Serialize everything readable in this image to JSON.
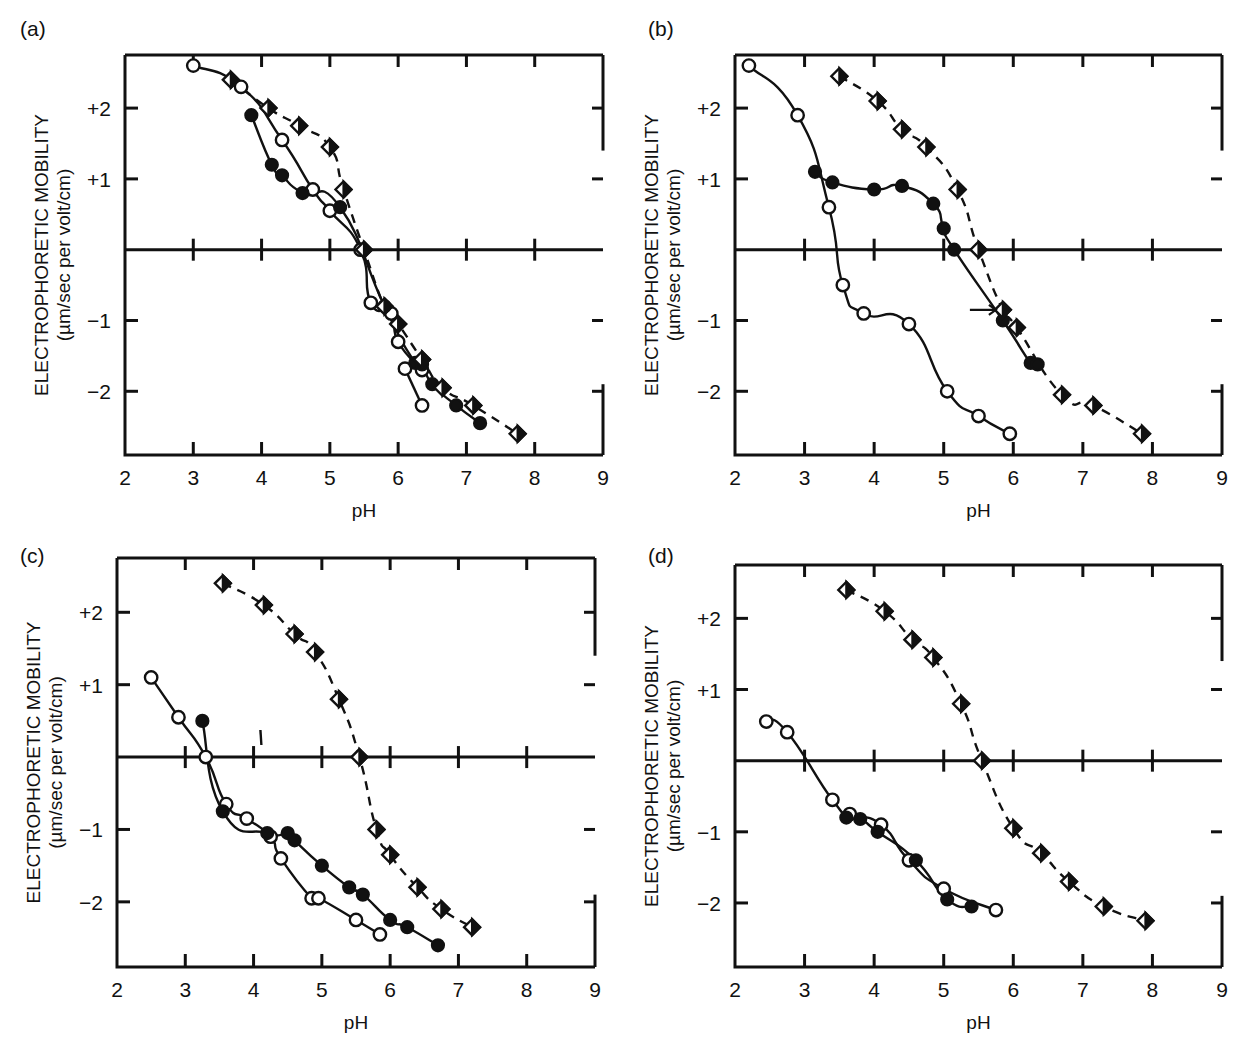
{
  "figure": {
    "panel_labels": [
      "(a)",
      "(b)",
      "(c)",
      "(d)"
    ],
    "xlabel": "pH",
    "ylabel_line1": "ELECTROPHORETIC MOBILITY",
    "ylabel_line2": "(µm/sec per volt/cm)",
    "x_tick_labels": [
      "2",
      "3",
      "4",
      "5",
      "6",
      "7",
      "8",
      "9"
    ],
    "y_tick_labels": [
      "+2",
      "+1",
      "−1",
      "−2"
    ]
  },
  "chart_data": [
    {
      "type": "line",
      "panel": "(a)",
      "title": "",
      "xlabel": "pH",
      "ylabel": "ELECTROPHORETIC MOBILITY (µm/sec per volt/cm)",
      "xlim": [
        2,
        9
      ],
      "ylim": [
        -2.9,
        2.75
      ],
      "xticks": [
        2,
        3,
        4,
        5,
        6,
        7,
        8,
        9
      ],
      "yticks": [
        2,
        1,
        -1,
        -2
      ],
      "grid": false,
      "legend": "none",
      "series": [
        {
          "name": "open-circle",
          "marker": "open-circle",
          "linestyle": "solid",
          "x": [
            3.0,
            3.7,
            4.3,
            4.75,
            5.0,
            5.45,
            5.6,
            5.9,
            6.0,
            6.35
          ],
          "y": [
            2.6,
            2.3,
            1.55,
            0.85,
            0.55,
            0.0,
            -0.75,
            -0.9,
            -1.3,
            -1.7
          ]
        },
        {
          "name": "open-circle-tail",
          "marker": "open-circle",
          "linestyle": "solid",
          "x": [
            6.1,
            6.35
          ],
          "y": [
            -1.68,
            -2.2
          ]
        },
        {
          "name": "filled-circle",
          "marker": "filled-circle",
          "linestyle": "solid",
          "x": [
            3.85,
            4.15,
            4.3,
            4.6,
            5.15,
            5.8,
            6.25,
            6.35,
            6.5,
            6.85,
            7.2
          ],
          "y": [
            1.9,
            1.2,
            1.05,
            0.8,
            0.6,
            -0.8,
            -1.6,
            -1.62,
            -1.9,
            -2.2,
            -2.45
          ]
        },
        {
          "name": "half-filled-diamond",
          "marker": "half-diamond",
          "linestyle": "dashed",
          "x": [
            3.55,
            4.1,
            4.55,
            5.0,
            5.2,
            5.5,
            5.8,
            6.0,
            6.35,
            6.65,
            7.1,
            7.75
          ],
          "y": [
            2.4,
            2.0,
            1.75,
            1.45,
            0.85,
            0.0,
            -0.8,
            -1.05,
            -1.55,
            -1.95,
            -2.2,
            -2.6
          ]
        }
      ]
    },
    {
      "type": "line",
      "panel": "(b)",
      "title": "",
      "xlabel": "pH",
      "ylabel": "ELECTROPHORETIC MOBILITY (µm/sec per volt/cm)",
      "xlim": [
        2,
        9
      ],
      "ylim": [
        -2.9,
        2.75
      ],
      "xticks": [
        2,
        3,
        4,
        5,
        6,
        7,
        8,
        9
      ],
      "yticks": [
        2,
        1,
        -1,
        -2
      ],
      "grid": false,
      "legend": "none",
      "annotations": [
        {
          "type": "arrow",
          "x": 5.75,
          "y": -0.85,
          "direction": "right"
        }
      ],
      "series": [
        {
          "name": "open-circle",
          "marker": "open-circle",
          "linestyle": "solid",
          "x": [
            2.2,
            2.9,
            3.35,
            3.55,
            3.85,
            4.5,
            5.05,
            5.5,
            5.95
          ],
          "y": [
            2.6,
            1.9,
            0.6,
            -0.5,
            -0.9,
            -1.05,
            -2.0,
            -2.35,
            -2.6
          ]
        },
        {
          "name": "filled-circle",
          "marker": "filled-circle",
          "linestyle": "solid",
          "x": [
            3.15,
            3.4,
            4.0,
            4.4,
            4.85,
            5.0,
            5.15,
            5.85,
            6.25,
            6.35
          ],
          "y": [
            1.1,
            0.95,
            0.85,
            0.9,
            0.65,
            0.3,
            0.0,
            -1.0,
            -1.6,
            -1.62
          ]
        },
        {
          "name": "half-filled-diamond",
          "marker": "half-diamond",
          "linestyle": "dashed",
          "x": [
            3.5,
            4.05,
            4.4,
            4.75,
            5.2,
            5.5,
            5.85,
            6.05,
            6.7,
            7.15,
            7.85
          ],
          "y": [
            2.45,
            2.1,
            1.7,
            1.45,
            0.85,
            0.0,
            -0.85,
            -1.1,
            -2.05,
            -2.2,
            -2.6
          ]
        }
      ]
    },
    {
      "type": "line",
      "panel": "(c)",
      "title": "",
      "xlabel": "pH",
      "ylabel": "ELECTROPHORETIC MOBILITY (µm/sec per volt/cm)",
      "xlim": [
        2,
        9
      ],
      "ylim": [
        -2.9,
        2.75
      ],
      "xticks": [
        2,
        3,
        4,
        5,
        6,
        7,
        8,
        9
      ],
      "yticks": [
        2,
        1,
        -1,
        -2
      ],
      "grid": false,
      "legend": "none",
      "annotations": [
        {
          "type": "tick-mark",
          "x": 4.1,
          "y": 0.25
        }
      ],
      "series": [
        {
          "name": "open-circle",
          "marker": "open-circle",
          "linestyle": "solid",
          "x": [
            2.5,
            2.9,
            3.3,
            3.6,
            3.9,
            4.25,
            4.4,
            4.85,
            4.95,
            5.5,
            5.85
          ],
          "y": [
            1.1,
            0.55,
            0.0,
            -0.65,
            -0.85,
            -1.1,
            -1.4,
            -1.95,
            -1.95,
            -2.25,
            -2.45
          ]
        },
        {
          "name": "filled-circle",
          "marker": "filled-circle",
          "linestyle": "solid",
          "x": [
            3.25,
            3.55,
            4.2,
            4.5,
            4.6,
            5.0,
            5.4,
            5.6,
            6.0,
            6.25,
            6.7
          ],
          "y": [
            0.5,
            -0.75,
            -1.05,
            -1.05,
            -1.15,
            -1.5,
            -1.8,
            -1.9,
            -2.25,
            -2.35,
            -2.6
          ]
        },
        {
          "name": "half-filled-diamond",
          "marker": "half-diamond",
          "linestyle": "dashed",
          "x": [
            3.55,
            4.15,
            4.6,
            4.9,
            5.25,
            5.55,
            5.8,
            6.0,
            6.4,
            6.75,
            7.2
          ],
          "y": [
            2.4,
            2.1,
            1.7,
            1.45,
            0.8,
            0.0,
            -1.0,
            -1.35,
            -1.8,
            -2.1,
            -2.35
          ]
        }
      ]
    },
    {
      "type": "line",
      "panel": "(d)",
      "title": "",
      "xlabel": "pH",
      "ylabel": "ELECTROPHORETIC MOBILITY (µm/sec per volt/cm)",
      "xlim": [
        2,
        9
      ],
      "ylim": [
        -2.9,
        2.75
      ],
      "xticks": [
        2,
        3,
        4,
        5,
        6,
        7,
        8,
        9
      ],
      "yticks": [
        2,
        1,
        -1,
        -2
      ],
      "grid": false,
      "legend": "none",
      "series": [
        {
          "name": "open-circle",
          "marker": "open-circle",
          "linestyle": "solid",
          "x": [
            2.45,
            2.75,
            3.4,
            3.65,
            4.1,
            4.5,
            5.0,
            5.75
          ],
          "y": [
            0.55,
            0.4,
            -0.55,
            -0.75,
            -0.9,
            -1.4,
            -1.8,
            -2.1
          ]
        },
        {
          "name": "filled-circle",
          "marker": "filled-circle",
          "linestyle": "solid",
          "x": [
            3.6,
            3.8,
            4.05,
            4.6,
            5.05,
            5.4
          ],
          "y": [
            -0.8,
            -0.82,
            -1.0,
            -1.4,
            -1.95,
            -2.05
          ]
        },
        {
          "name": "half-filled-diamond",
          "marker": "half-diamond",
          "linestyle": "dashed",
          "x": [
            3.6,
            4.15,
            4.55,
            4.85,
            5.25,
            5.55,
            6.0,
            6.4,
            6.8,
            7.3,
            7.9
          ],
          "y": [
            2.4,
            2.1,
            1.7,
            1.45,
            0.8,
            0.0,
            -0.95,
            -1.3,
            -1.7,
            -2.05,
            -2.25,
            -2.6
          ]
        }
      ]
    }
  ]
}
